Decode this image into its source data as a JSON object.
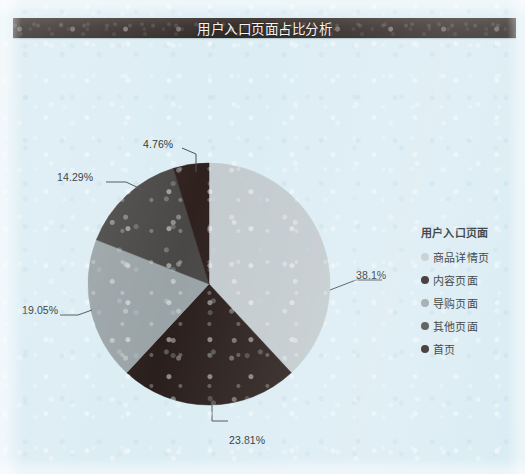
{
  "chart_title": "用户入口页面占比分析",
  "legend": {
    "title": "用户入口页面",
    "items": [
      {
        "label": "商品详情页",
        "color": "#c3cbce"
      },
      {
        "label": "内容页面",
        "color": "#2a1f1c"
      },
      {
        "label": "导购页面",
        "color": "#9aa3a6"
      },
      {
        "label": "其他页面",
        "color": "#4a4846"
      },
      {
        "label": "首页",
        "color": "#2e211e"
      }
    ]
  },
  "chart_data": {
    "type": "pie",
    "title": "用户入口页面占比分析",
    "categories": [
      "商品详情页",
      "内容页面",
      "导购页面",
      "其他页面",
      "首页"
    ],
    "values": [
      38.1,
      23.81,
      19.05,
      14.29,
      4.76
    ],
    "labels": [
      "38.1%",
      "23.81%",
      "19.05%",
      "14.29%",
      "4.76%"
    ],
    "colors": [
      "#c3cbce",
      "#2a1f1c",
      "#9aa3a6",
      "#4a4846",
      "#2e211e"
    ],
    "unit": "%",
    "start_angle_deg": 0,
    "direction": "clockwise",
    "legend_position": "right",
    "legend_title": "用户入口页面",
    "grid": false,
    "xlabel": "",
    "ylabel": ""
  },
  "percent_labels": {
    "p0": "38.1%",
    "p1": "23.81%",
    "p2": "19.05%",
    "p3": "14.29%",
    "p4": "4.76%"
  },
  "colors": {
    "background": "#dcedf4",
    "title_bar": "#372f2c",
    "title_text": "#f2f4f5",
    "label_text": "#2b3033",
    "leader_line": "#4c5356"
  }
}
